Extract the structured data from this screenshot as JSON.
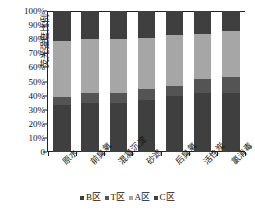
{
  "chart_data": {
    "type": "bar",
    "subtype": "stacked-percentage-column",
    "title": "",
    "xlabel": "",
    "ylabel": "荧光强度比例",
    "ylim": [
      0,
      100
    ],
    "ytick_labels": [
      "100%",
      "90%",
      "80%",
      "70%",
      "60%",
      "50%",
      "40%",
      "30%",
      "20%",
      "10%",
      "0"
    ],
    "ytick_values": [
      100,
      90,
      80,
      70,
      60,
      50,
      40,
      30,
      20,
      10,
      0
    ],
    "grid": false,
    "legend_position": "bottom",
    "categories": [
      "原水",
      "前臭氧",
      "混凝沉淀",
      "砂滤",
      "后臭氧",
      "活性炭",
      "氯消毒"
    ],
    "series": [
      {
        "name": "B区",
        "color": "#3f3f3f",
        "values": [
          33,
          35,
          35,
          37,
          40,
          42,
          42
        ]
      },
      {
        "name": "T区",
        "color": "#545454",
        "values": [
          6,
          7,
          7,
          8,
          7,
          10,
          11
        ]
      },
      {
        "name": "A区",
        "color": "#a6a6a6",
        "values": [
          40,
          38,
          38,
          36,
          36,
          32,
          33
        ]
      },
      {
        "name": "C区",
        "color": "#3f3f3f",
        "values": [
          21,
          20,
          20,
          19,
          17,
          16,
          14
        ]
      }
    ]
  },
  "axis": {
    "y_label": "荧光强度比例",
    "y_ticks": [
      "100%",
      "90%",
      "80%",
      "70%",
      "60%",
      "50%",
      "40%",
      "30%",
      "20%",
      "10%",
      "0"
    ],
    "x_ticks": [
      "原水",
      "前臭氧",
      "混凝沉淀",
      "砂滤",
      "后臭氧",
      "活性炭",
      "氯消毒"
    ]
  },
  "legend": {
    "items": [
      {
        "label": "B区",
        "color": "#3f3f3f"
      },
      {
        "label": "T区",
        "color": "#545454"
      },
      {
        "label": "A区",
        "color": "#a6a6a6"
      },
      {
        "label": "C区",
        "color": "#3f3f3f"
      }
    ]
  },
  "colors": {
    "axis": "#222222",
    "background": "#ffffff",
    "segment_b": "#3f3f3f",
    "segment_t": "#545454",
    "segment_a": "#a6a6a6",
    "segment_c": "#3f3f3f"
  }
}
